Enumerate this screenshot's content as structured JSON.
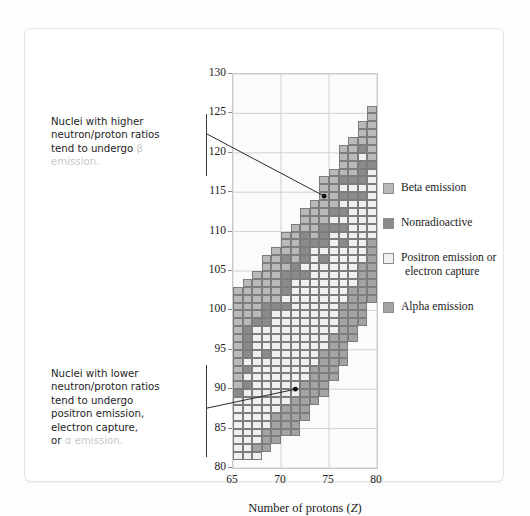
{
  "figure": {
    "xlabel_prefix": "Number of protons (",
    "xlabel_var": "Z",
    "xlabel_suffix": ")",
    "ylabel_prefix": "Number of neutrons (",
    "ylabel_var": "N",
    "ylabel_suffix": ")"
  },
  "annotations": {
    "upper": {
      "line1": "Nuclei with higher",
      "line2": "neutron/proton ratios",
      "line3": "tend to undergo ",
      "line3_faded": "β",
      "line4_faded": "emission."
    },
    "lower": {
      "line1": "Nuclei with lower",
      "line2": "neutron/proton ratios",
      "line3": "tend to undergo",
      "line4": "positron emission,",
      "line5": "electron capture,",
      "line6": "or ",
      "line6_faded": "α emission."
    }
  },
  "legend": {
    "position": "right",
    "items": [
      {
        "label": "Beta emission",
        "color": "#b9b9b9",
        "key": "beta"
      },
      {
        "label": "Nonradioactive",
        "color": "#8a8a8a",
        "key": "stable"
      },
      {
        "label": "Positron emission or",
        "label2": "electron capture",
        "color": "#efefef",
        "key": "positron"
      },
      {
        "label": "Alpha emission",
        "color": "#a3a3a3",
        "key": "alpha"
      }
    ]
  },
  "chart_data": {
    "type": "heatmap",
    "title": "",
    "xlabel": "Number of protons (Z)",
    "ylabel": "Number of neutrons (N)",
    "xlim": [
      65,
      80
    ],
    "ylim": [
      80,
      130
    ],
    "xticks": [
      65,
      70,
      75,
      80
    ],
    "yticks": [
      80,
      85,
      90,
      95,
      100,
      105,
      110,
      115,
      120,
      125,
      130
    ],
    "grid": true,
    "cell_size": {
      "z": 1,
      "n": 1
    },
    "categories": {
      "beta": {
        "label": "Beta emission",
        "color": "#b9b9b9"
      },
      "stable": {
        "label": "Nonradioactive",
        "color": "#8a8a8a"
      },
      "positron": {
        "label": "Positron emission or electron capture",
        "color": "#efefef"
      },
      "alpha": {
        "label": "Alpha emission",
        "color": "#a3a3a3"
      }
    },
    "annotation_points": [
      {
        "z": 74,
        "n": 114.5,
        "note": "upper callout target"
      },
      {
        "z": 71,
        "n": 90,
        "note": "lower callout target"
      }
    ],
    "columns": [
      {
        "z": 65,
        "n_min": 81,
        "n_max": 102,
        "stable": [
          89
        ],
        "beta": [
          90,
          91,
          92,
          93,
          94,
          95,
          96,
          97,
          98,
          99,
          100,
          101,
          102
        ],
        "alpha": [],
        "positron": [
          81,
          82,
          83,
          84,
          85,
          86,
          87,
          88
        ]
      },
      {
        "z": 66,
        "n": "col",
        "n_min": 81,
        "n_max": 103,
        "stable": [
          90,
          92,
          94,
          95,
          96,
          97
        ],
        "beta": [
          98,
          99,
          100,
          101,
          102,
          103
        ],
        "alpha": [],
        "positron": [
          81,
          82,
          83,
          84,
          85,
          86,
          87,
          88,
          89,
          91,
          93
        ]
      },
      {
        "z": 67,
        "n_min": 81,
        "n_max": 104,
        "stable": [
          98
        ],
        "beta": [
          99,
          100,
          101,
          102,
          103,
          104
        ],
        "alpha": [
          82
        ],
        "positron": [
          81,
          83,
          84,
          85,
          86,
          87,
          88,
          89,
          90,
          91,
          92,
          93,
          94,
          95,
          96,
          97
        ]
      },
      {
        "z": 68,
        "n_min": 82,
        "n_max": 106,
        "stable": [
          94,
          98,
          99,
          100
        ],
        "beta": [
          101,
          102,
          103,
          104,
          105,
          106
        ],
        "alpha": [
          82,
          83,
          84
        ],
        "positron": [
          85,
          86,
          87,
          88,
          89,
          90,
          91,
          92,
          93,
          95,
          96,
          97
        ]
      },
      {
        "z": 69,
        "n_min": 83,
        "n_max": 107,
        "stable": [
          100
        ],
        "beta": [
          101,
          102,
          103,
          104,
          105,
          106,
          107
        ],
        "alpha": [
          83,
          84,
          85,
          86
        ],
        "positron": [
          87,
          88,
          89,
          90,
          91,
          92,
          93,
          94,
          95,
          96,
          97,
          98,
          99
        ]
      },
      {
        "z": 70,
        "n_min": 84,
        "n_max": 109,
        "stable": [
          100,
          102,
          103,
          104,
          106
        ],
        "beta": [
          105,
          107,
          108,
          109
        ],
        "alpha": [
          84,
          85,
          86,
          87
        ],
        "positron": [
          88,
          89,
          90,
          91,
          92,
          93,
          94,
          95,
          96,
          97,
          98,
          99,
          101
        ]
      },
      {
        "z": 71,
        "n_min": 84,
        "n_max": 110,
        "stable": [
          104,
          105
        ],
        "beta": [
          106,
          107,
          108,
          109,
          110
        ],
        "alpha": [
          84,
          85,
          86,
          87,
          88
        ],
        "positron": [
          89,
          90,
          91,
          92,
          93,
          94,
          95,
          96,
          97,
          98,
          99,
          100,
          101,
          102,
          103
        ]
      },
      {
        "z": 72,
        "n_min": 86,
        "n_max": 112,
        "stable": [
          104,
          106,
          107,
          108,
          109
        ],
        "beta": [
          110,
          111,
          112
        ],
        "alpha": [
          86,
          87,
          88,
          89,
          90
        ],
        "positron": [
          91,
          92,
          93,
          94,
          95,
          96,
          97,
          98,
          99,
          100,
          101,
          102,
          103,
          105
        ]
      },
      {
        "z": 73,
        "n_min": 88,
        "n_max": 113,
        "stable": [
          108
        ],
        "beta": [
          109,
          110,
          111,
          112,
          113
        ],
        "alpha": [
          88,
          89,
          90,
          91,
          92
        ],
        "positron": [
          93,
          94,
          95,
          96,
          97,
          98,
          99,
          100,
          101,
          102,
          103,
          104,
          105,
          106,
          107
        ]
      },
      {
        "z": 74,
        "n_min": 89,
        "n_max": 116,
        "stable": [
          106,
          108,
          109,
          110
        ],
        "beta": [
          111,
          112,
          113,
          114,
          115,
          116
        ],
        "alpha": [
          89,
          90,
          91,
          92,
          93,
          94
        ],
        "positron": [
          95,
          96,
          97,
          98,
          99,
          100,
          101,
          102,
          103,
          104,
          105,
          107
        ]
      },
      {
        "z": 75,
        "n_min": 91,
        "n_max": 117,
        "stable": [
          110,
          112
        ],
        "beta": [
          113,
          114,
          115,
          116,
          117
        ],
        "alpha": [
          91,
          92,
          93,
          94,
          95,
          96
        ],
        "positron": [
          97,
          98,
          99,
          100,
          101,
          102,
          103,
          104,
          105,
          106,
          107,
          108,
          109,
          111
        ]
      },
      {
        "z": 76,
        "n_min": 93,
        "n_max": 120,
        "stable": [
          108,
          110,
          112,
          114,
          116
        ],
        "beta": [
          117,
          118,
          119,
          120
        ],
        "alpha": [
          93,
          94,
          95,
          96,
          97,
          98,
          99,
          100
        ],
        "positron": [
          101,
          102,
          103,
          104,
          105,
          106,
          107,
          109,
          111,
          113,
          115
        ]
      },
      {
        "z": 77,
        "n_min": 96,
        "n_max": 121,
        "stable": [
          114,
          116
        ],
        "beta": [
          117,
          118,
          119,
          120,
          121
        ],
        "alpha": [
          96,
          97,
          98,
          99,
          100,
          101,
          102
        ],
        "positron": [
          103,
          104,
          105,
          106,
          107,
          108,
          109,
          110,
          111,
          112,
          113,
          115
        ]
      },
      {
        "z": 78,
        "n_min": 98,
        "n_max": 123,
        "stable": [
          114,
          116,
          117,
          118,
          120
        ],
        "beta": [
          121,
          122,
          123
        ],
        "alpha": [
          98,
          99,
          100,
          101,
          102,
          103,
          104,
          105
        ],
        "positron": [
          106,
          107,
          108,
          109,
          110,
          111,
          112,
          113,
          115,
          119
        ]
      },
      {
        "z": 79,
        "n_min": 101,
        "n_max": 125,
        "stable": [
          118
        ],
        "beta": [
          119,
          120,
          121,
          122,
          123,
          124,
          125
        ],
        "alpha": [
          101,
          102,
          103,
          104,
          105,
          106,
          107,
          108
        ],
        "positron": [
          109,
          110,
          111,
          112,
          113,
          114,
          115,
          116,
          117
        ]
      }
    ]
  }
}
